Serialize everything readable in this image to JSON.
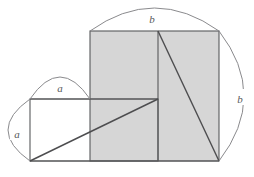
{
  "figure": {
    "type": "geometry-diagram",
    "labels": {
      "top_arc": "b",
      "right_arc": "b",
      "small_top_arc": "a",
      "small_left_arc": "a"
    },
    "colors": {
      "shaded_fill": "#d6d6d6",
      "stroke": "#58595b",
      "diagonal_stroke": "#4d4d4f",
      "arc_stroke": "#8a8a8d",
      "background": "#ffffff",
      "unshaded_fill": "#ffffff"
    },
    "geometry": {
      "big_square": {
        "x": 90,
        "y": 31,
        "width": 129,
        "height": 130
      },
      "lower_rect": {
        "x": 30,
        "y": 99,
        "width": 128,
        "height": 62
      },
      "vertical_divider_x": 158,
      "horizontal_divider_y": 99,
      "diagonal_1": {
        "x1": 30,
        "y1": 161,
        "x2": 158,
        "y2": 99
      },
      "diagonal_2": {
        "x1": 158,
        "y1": 31,
        "x2": 219,
        "y2": 161
      },
      "side_a": 62,
      "side_b": 130
    },
    "arcs": {
      "top": {
        "x1": 90,
        "y1": 31,
        "x2": 219,
        "y2": 31,
        "label_x": 152,
        "label_y": 19
      },
      "right": {
        "x1": 219,
        "y1": 31,
        "x2": 219,
        "y2": 161,
        "label_x": 240,
        "label_y": 99
      },
      "small_top": {
        "x1": 30,
        "y1": 99,
        "x2": 90,
        "y2": 99,
        "label_x": 60,
        "label_y": 88
      },
      "small_left": {
        "x1": 30,
        "y1": 99,
        "x2": 30,
        "y2": 161,
        "label_x": 17,
        "label_y": 134
      }
    }
  }
}
